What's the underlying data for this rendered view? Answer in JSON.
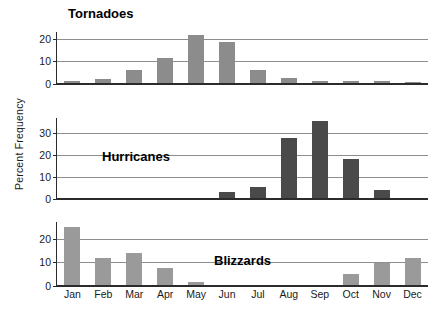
{
  "chart_data": {
    "type": "bar",
    "title": "",
    "ylabel": "Percent Frequency",
    "xlabel": "",
    "grid": true,
    "legend": "none",
    "categories": [
      "Jan",
      "Feb",
      "Mar",
      "Apr",
      "May",
      "Jun",
      "Jul",
      "Aug",
      "Sep",
      "Oct",
      "Nov",
      "Dec"
    ],
    "panels": [
      {
        "name": "tornadoes",
        "title": "Tornadoes",
        "color": "#8c8c8c",
        "ylim": [
          0,
          23
        ],
        "yticks": [
          0,
          10,
          20
        ],
        "ytick_labels": [
          "0",
          "10",
          "20"
        ],
        "values": [
          1.5,
          2.3,
          6.0,
          11.5,
          21.5,
          18.5,
          6.0,
          2.5,
          1.5,
          1.2,
          1.2,
          1.0
        ]
      },
      {
        "name": "hurricanes",
        "title": "Hurricanes",
        "color": "#4a4a4a",
        "ylim": [
          0,
          37
        ],
        "yticks": [
          0,
          10,
          20,
          30
        ],
        "ytick_labels": [
          "0",
          "10",
          "20",
          "30"
        ],
        "values": [
          0,
          0,
          0,
          0,
          0,
          3.0,
          5.5,
          28.0,
          35.5,
          18.5,
          4.0,
          0
        ]
      },
      {
        "name": "blizzards",
        "title": "Blizzards",
        "color": "#9a9a9a",
        "ylim": [
          0,
          27
        ],
        "yticks": [
          0,
          10,
          20
        ],
        "ytick_labels": [
          "0",
          "10",
          "20"
        ],
        "values": [
          25.0,
          12.0,
          14.0,
          7.5,
          1.5,
          0,
          0,
          0,
          0,
          5.0,
          9.5,
          12.0
        ]
      }
    ]
  }
}
